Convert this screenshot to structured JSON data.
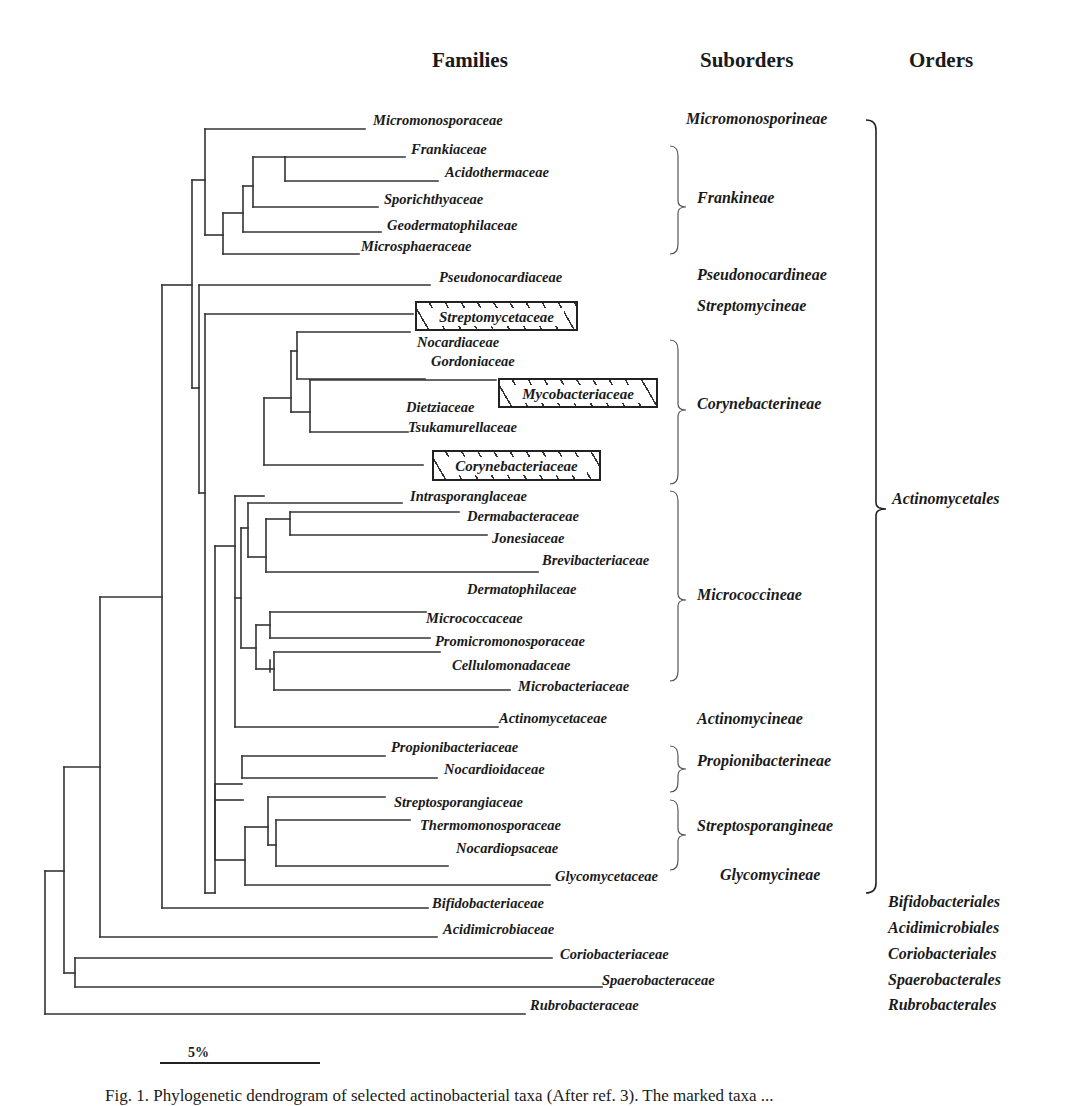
{
  "headers": {
    "families": "Families",
    "suborders": "Suborders",
    "orders": "Orders"
  },
  "families": [
    {
      "name": "Micromonosporaceae",
      "x": 373,
      "y": 120
    },
    {
      "name": "Frankiaceae",
      "x": 411,
      "y": 149
    },
    {
      "name": "Acidothermaceae",
      "x": 445,
      "y": 172
    },
    {
      "name": "Sporichthyaceae",
      "x": 384,
      "y": 199
    },
    {
      "name": "Geodermatophilaceae",
      "x": 387,
      "y": 225
    },
    {
      "name": "Microsphaeraceae",
      "x": 361,
      "y": 246
    },
    {
      "name": "Pseudonocardiaceae",
      "x": 439,
      "y": 277
    },
    {
      "name": "Nocardiaceae",
      "x": 417,
      "y": 342
    },
    {
      "name": "Gordoniaceae",
      "x": 431,
      "y": 361
    },
    {
      "name": "Dietziaceae",
      "x": 406,
      "y": 407
    },
    {
      "name": "Tsukamurellaceae",
      "x": 408,
      "y": 427
    },
    {
      "name": "Intrasporanglaceae",
      "x": 410,
      "y": 496
    },
    {
      "name": "Dermabacteraceae",
      "x": 467,
      "y": 516
    },
    {
      "name": "Jonesiaceae",
      "x": 492,
      "y": 538
    },
    {
      "name": "Brevibacteriaceae",
      "x": 542,
      "y": 560
    },
    {
      "name": "Dermatophilaceae",
      "x": 467,
      "y": 589
    },
    {
      "name": "Micrococcaceae",
      "x": 426,
      "y": 618
    },
    {
      "name": "Promicromonosporaceae",
      "x": 435,
      "y": 641
    },
    {
      "name": "Cellulomonadaceae",
      "x": 452,
      "y": 665
    },
    {
      "name": "Microbacteriaceae",
      "x": 518,
      "y": 686
    },
    {
      "name": "Actinomycetaceae",
      "x": 499,
      "y": 718
    },
    {
      "name": "Propionibacteriaceae",
      "x": 391,
      "y": 747
    },
    {
      "name": "Nocardioidaceae",
      "x": 444,
      "y": 769
    },
    {
      "name": "Streptosporangiaceae",
      "x": 394,
      "y": 802
    },
    {
      "name": "Thermomonosporaceae",
      "x": 420,
      "y": 825
    },
    {
      "name": "Nocardiopsaceae",
      "x": 456,
      "y": 848
    },
    {
      "name": "Glycomycetaceae",
      "x": 555,
      "y": 876
    },
    {
      "name": "Bifidobacteriaceae",
      "x": 432,
      "y": 903
    },
    {
      "name": "Acidimicrobiaceae",
      "x": 443,
      "y": 929
    },
    {
      "name": "Coriobacteriaceae",
      "x": 560,
      "y": 954
    },
    {
      "name": "Spaerobacteraceae",
      "x": 602,
      "y": 980
    },
    {
      "name": "Rubrobacteraceae",
      "x": 530,
      "y": 1005
    }
  ],
  "highlighted_families": [
    {
      "name": "Streptomycetaceae",
      "x": 415,
      "y": 301,
      "w": 163,
      "h": 30
    },
    {
      "name": "Mycobacteriaceae",
      "x": 498,
      "y": 378,
      "w": 160,
      "h": 30
    },
    {
      "name": "Corynebacteriaceae",
      "x": 432,
      "y": 450,
      "w": 169,
      "h": 31
    }
  ],
  "suborders": [
    {
      "name": "Micromonosporineae",
      "x": 686,
      "y": 118
    },
    {
      "name": "Frankineae",
      "x": 697,
      "y": 197
    },
    {
      "name": "Pseudonocardineae",
      "x": 697,
      "y": 274
    },
    {
      "name": "Streptomycineae",
      "x": 697,
      "y": 305
    },
    {
      "name": "Corynebacterineae",
      "x": 697,
      "y": 403
    },
    {
      "name": "Micrococcineae",
      "x": 697,
      "y": 594
    },
    {
      "name": "Actinomycineae",
      "x": 697,
      "y": 718
    },
    {
      "name": "Propionibacterineae",
      "x": 697,
      "y": 760
    },
    {
      "name": "Streptosporangineae",
      "x": 697,
      "y": 825
    },
    {
      "name": "Glycomycineae",
      "x": 720,
      "y": 874
    }
  ],
  "orders": [
    {
      "name": "Actinomycetales",
      "x": 892,
      "y": 498
    },
    {
      "name": "Bifidobacteriales",
      "x": 888,
      "y": 901
    },
    {
      "name": "Acidimicrobiales",
      "x": 888,
      "y": 927
    },
    {
      "name": "Coriobacteriales",
      "x": 888,
      "y": 953
    },
    {
      "name": "Spaerobacterales",
      "x": 888,
      "y": 979
    },
    {
      "name": "Rubrobacterales",
      "x": 888,
      "y": 1004
    }
  ],
  "scale_bar": {
    "label": "5%",
    "x1": 160,
    "x2": 320,
    "y": 1063
  },
  "caption": "Fig. 1. Phylogenetic dendrogram of selected actinobacterial taxa (After ref. 3). The marked taxa ...",
  "line_color": "#333333",
  "tree_segments": [
    [
      45,
      871,
      45,
      1014
    ],
    [
      45,
      1014,
      525,
      1014
    ],
    [
      45,
      871,
      64,
      871
    ],
    [
      64,
      767,
      64,
      973
    ],
    [
      64,
      973,
      75,
      973
    ],
    [
      75,
      958,
      75,
      987
    ],
    [
      75,
      958,
      552,
      958
    ],
    [
      75,
      987,
      602,
      987
    ],
    [
      64,
      767,
      100,
      767
    ],
    [
      100,
      597,
      100,
      937
    ],
    [
      100,
      937,
      437,
      937
    ],
    [
      100,
      597,
      162,
      597
    ],
    [
      162,
      285,
      162,
      908
    ],
    [
      162,
      908,
      428,
      908
    ],
    [
      162,
      285,
      192,
      285
    ],
    [
      192,
      180,
      192,
      388
    ],
    [
      192,
      180,
      205,
      180
    ],
    [
      205,
      129,
      205,
      235
    ],
    [
      205,
      129,
      365,
      129
    ],
    [
      205,
      235,
      223,
      235
    ],
    [
      223,
      213,
      223,
      254
    ],
    [
      223,
      254,
      359,
      254
    ],
    [
      223,
      213,
      243,
      213
    ],
    [
      243,
      186,
      243,
      232
    ],
    [
      243,
      232,
      381,
      232
    ],
    [
      243,
      186,
      253,
      186
    ],
    [
      253,
      157,
      253,
      207
    ],
    [
      253,
      207,
      378,
      207
    ],
    [
      253,
      157,
      285,
      157
    ],
    [
      285,
      157,
      285,
      181
    ],
    [
      285,
      157,
      405,
      157
    ],
    [
      285,
      181,
      438,
      181
    ],
    [
      192,
      388,
      199,
      388
    ],
    [
      199,
      285,
      199,
      493
    ],
    [
      199,
      285,
      430,
      285
    ],
    [
      199,
      493,
      205,
      493
    ],
    [
      205,
      314,
      205,
      893
    ],
    [
      205,
      314,
      413,
      314
    ],
    [
      205,
      893,
      215,
      893
    ],
    [
      215,
      546,
      215,
      893
    ],
    [
      215,
      546,
      235,
      546
    ],
    [
      235,
      496,
      235,
      727
    ],
    [
      235,
      496,
      264,
      496
    ],
    [
      264,
      398,
      264,
      465
    ],
    [
      264,
      398,
      291,
      398
    ],
    [
      291,
      351,
      291,
      412
    ],
    [
      291,
      412,
      310,
      412
    ],
    [
      310,
      380,
      310,
      432
    ],
    [
      310,
      380,
      496,
      380
    ],
    [
      310,
      432,
      408,
      432
    ],
    [
      291,
      351,
      297,
      351
    ],
    [
      297,
      332,
      297,
      379
    ],
    [
      297,
      332,
      410,
      332
    ],
    [
      297,
      379,
      425,
      379
    ],
    [
      264,
      465,
      423,
      465
    ],
    [
      235,
      727,
      498,
      727
    ],
    [
      235,
      598,
      241,
      598
    ],
    [
      241,
      528,
      241,
      648
    ],
    [
      241,
      528,
      248,
      528
    ],
    [
      248,
      503,
      248,
      557
    ],
    [
      248,
      503,
      402,
      503
    ],
    [
      248,
      557,
      266,
      557
    ],
    [
      266,
      519,
      266,
      572
    ],
    [
      266,
      519,
      290,
      519
    ],
    [
      290,
      512,
      290,
      535
    ],
    [
      290,
      512,
      459,
      512
    ],
    [
      290,
      535,
      487,
      535
    ],
    [
      266,
      572,
      538,
      572
    ],
    [
      241,
      648,
      256,
      648
    ],
    [
      256,
      625,
      256,
      669
    ],
    [
      256,
      625,
      270,
      625
    ],
    [
      270,
      612,
      270,
      638
    ],
    [
      270,
      612,
      426,
      612
    ],
    [
      270,
      638,
      430,
      638
    ],
    [
      270,
      660,
      270,
      672
    ],
    [
      256,
      669,
      274,
      669
    ],
    [
      274,
      652,
      274,
      690
    ],
    [
      274,
      652,
      440,
      652
    ],
    [
      274,
      690,
      510,
      690
    ],
    [
      215,
      784,
      242,
      784
    ],
    [
      242,
      756,
      242,
      778
    ],
    [
      242,
      756,
      385,
      756
    ],
    [
      242,
      778,
      437,
      778
    ],
    [
      215,
      800,
      243,
      800
    ],
    [
      215,
      784,
      215,
      860
    ],
    [
      215,
      860,
      245,
      860
    ],
    [
      245,
      827,
      245,
      885
    ],
    [
      245,
      827,
      268,
      827
    ],
    [
      268,
      797,
      268,
      845
    ],
    [
      268,
      797,
      385,
      797
    ],
    [
      268,
      845,
      276,
      845
    ],
    [
      276,
      820,
      276,
      866
    ],
    [
      276,
      820,
      410,
      820
    ],
    [
      276,
      866,
      448,
      866
    ],
    [
      245,
      885,
      550,
      885
    ]
  ],
  "braces": [
    {
      "x": 678,
      "y1": 146,
      "y2": 254,
      "mid": 207
    },
    {
      "x": 678,
      "y1": 340,
      "y2": 484,
      "mid": 410
    },
    {
      "x": 678,
      "y1": 491,
      "y2": 681,
      "mid": 600
    },
    {
      "x": 678,
      "y1": 746,
      "y2": 792,
      "mid": 769
    },
    {
      "x": 678,
      "y1": 800,
      "y2": 870,
      "mid": 835
    }
  ],
  "big_brace": {
    "x": 876,
    "y1": 120,
    "y2": 893,
    "mid": 509
  }
}
